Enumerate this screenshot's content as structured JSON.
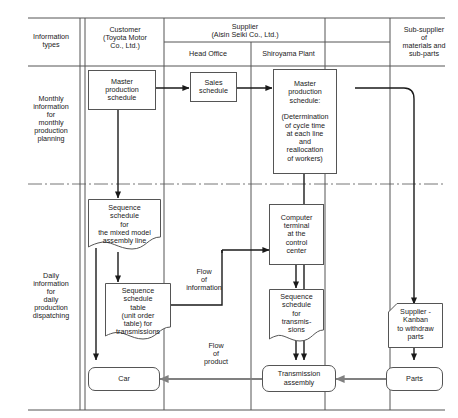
{
  "diagram": {
    "columns": [
      {
        "id": "information-types",
        "label": "Information\ntypes"
      },
      {
        "id": "customer",
        "label": "Customer\n(Toyota Motor\nCo., Ltd.)"
      },
      {
        "id": "supplier",
        "label": "Supplier\n(Aisin Seiki Co., Ltd.)"
      },
      {
        "id": "sub-supplier",
        "label": "Sub-supplier\nof\nmaterials and\nsub-parts"
      }
    ],
    "subcolumns": [
      {
        "id": "head-office",
        "label": "Head Office"
      },
      {
        "id": "shiroyama-plant",
        "label": "Shiroyama Plant"
      }
    ],
    "rows": [
      {
        "id": "monthly",
        "label": "Monthly\ninformation\nfor\nmonthly\nproduction\nplanning"
      },
      {
        "id": "daily",
        "label": "Daily\ninformation\nfor\ndaily\nproduction\ndispatching"
      }
    ],
    "nodes": [
      {
        "id": "master-production-schedule-customer",
        "label": "Master\nproduction\nschedule",
        "shape": "rect"
      },
      {
        "id": "sales-schedule",
        "label": "Sales\nschedule",
        "shape": "rect"
      },
      {
        "id": "master-production-schedule-plant",
        "label": "Master\nproduction\nschedule:\n\n(Determination\nof cycle time\nat each line\nand\nreallocation\nof workers)",
        "shape": "rect"
      },
      {
        "id": "sequence-schedule-mixed-model",
        "label": "Sequence\nschedule\nfor\nthe mixed model\nassembly line",
        "shape": "document"
      },
      {
        "id": "sequence-schedule-table",
        "label": "Sequence\nschedule\ntable\n(unit order\ntable) for\ntransmissions",
        "shape": "document"
      },
      {
        "id": "computer-terminal",
        "label": "Computer\nterminal\nat the\ncontrol\ncenter",
        "shape": "rect"
      },
      {
        "id": "sequence-schedule-transmissions",
        "label": "Sequence\nschedule\nfor\ntransmis-\nsions",
        "shape": "document"
      },
      {
        "id": "supplier-kanban",
        "label": "Supplier -\nKanban\nto withdraw\nparts",
        "shape": "kanban"
      },
      {
        "id": "car",
        "label": "Car",
        "shape": "rounded"
      },
      {
        "id": "transmission-assembly",
        "label": "Transmission\nassembly",
        "shape": "rounded"
      },
      {
        "id": "parts",
        "label": "Parts",
        "shape": "rounded"
      }
    ],
    "annotations": [
      {
        "id": "flow-of-information",
        "label": "Flow\nof\ninformation"
      },
      {
        "id": "flow-of-product",
        "label": "Flow\nof\nproduct"
      }
    ],
    "colors": {
      "line": "#555555",
      "arrow_info": "#1a1a1a",
      "arrow_product": "#808080",
      "text": "#1a1a1a",
      "background": "#ffffff"
    }
  }
}
